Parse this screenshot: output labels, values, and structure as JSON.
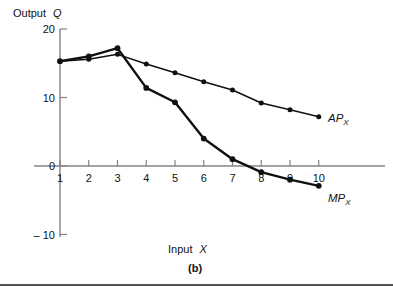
{
  "figure": {
    "caption": "(b)",
    "bottom_rule": true
  },
  "axes": {
    "y_title": "Output Q",
    "y_title_plain": "Output",
    "y_title_italic": "Q",
    "x_title_plain": "Input",
    "x_title_italic": "X",
    "x_title": "Input X",
    "y_ticks": [
      "20",
      "10",
      "0",
      "– 10"
    ],
    "y_tick_values": [
      20,
      10,
      0,
      -10
    ],
    "x_ticks": [
      "1",
      "2",
      "3",
      "4",
      "5",
      "6",
      "7",
      "8",
      "9",
      "10"
    ],
    "x_tick_values": [
      1,
      2,
      3,
      4,
      5,
      6,
      7,
      8,
      9,
      10
    ],
    "axis_color": "#838383",
    "curve_color": "#101010"
  },
  "labels": {
    "ap": {
      "base": "AP",
      "sub": "X",
      "full": "AP_X"
    },
    "mp": {
      "base": "MP",
      "sub": "X",
      "full": "MP_X"
    }
  },
  "chart_data": {
    "type": "line",
    "title": "",
    "subtitle": "(b)",
    "xlabel": "Input X",
    "ylabel": "Output Q",
    "xlim": [
      0.4,
      10.9
    ],
    "ylim": [
      -10,
      20
    ],
    "x": [
      1,
      2,
      3,
      4,
      5,
      6,
      7,
      8,
      9,
      10
    ],
    "grid": false,
    "legend_position": "right-of-line-end",
    "series": [
      {
        "name": "AP_X",
        "label": "AP",
        "label_sub": "X",
        "color": "#101010",
        "values": [
          15.3,
          15.6,
          16.3,
          14.9,
          13.6,
          12.3,
          11.1,
          9.2,
          8.2,
          7.2
        ]
      },
      {
        "name": "MP_X",
        "label": "MP",
        "label_sub": "X",
        "color": "#101010",
        "values": [
          15.3,
          16.0,
          17.2,
          11.4,
          9.3,
          4.0,
          1.0,
          -0.9,
          -2.0,
          -2.9
        ]
      }
    ]
  }
}
